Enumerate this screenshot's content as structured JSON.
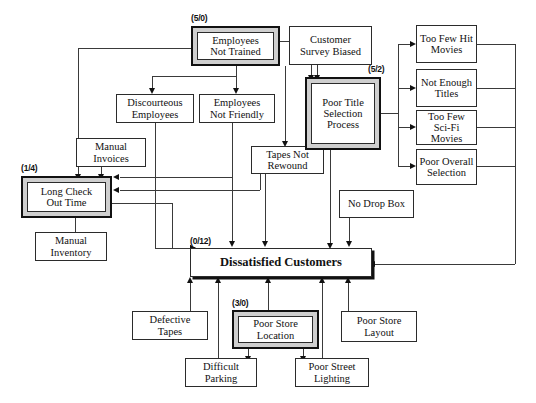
{
  "diagram": {
    "type": "cause-and-effect / interrelationship digraph",
    "effect": {
      "label": "Dissatisfied Customers",
      "tag": "(0/12)"
    },
    "nodes": [
      {
        "id": "employees_not_trained",
        "label": "Employees\nNot Trained",
        "tag": "(5/0)",
        "emphasis": true
      },
      {
        "id": "customer_survey_biased",
        "label": "Customer\nSurvey Biased",
        "tag": "",
        "emphasis": false
      },
      {
        "id": "poor_title_selection",
        "label": "Poor Title\nSelection\nProcess",
        "tag": "(5/2)",
        "emphasis": true
      },
      {
        "id": "too_few_hit_movies",
        "label": "Too Few Hit\nMovies",
        "tag": "",
        "emphasis": false
      },
      {
        "id": "not_enough_titles",
        "label": "Not Enough\nTitles",
        "tag": "",
        "emphasis": false
      },
      {
        "id": "too_few_scifi_movies",
        "label": "Too Few Sci-Fi\nMovies",
        "tag": "",
        "emphasis": false
      },
      {
        "id": "poor_overall_selection",
        "label": "Poor Overall\nSelection",
        "tag": "",
        "emphasis": false
      },
      {
        "id": "discourteous_employees",
        "label": "Discourteous\nEmployees",
        "tag": "",
        "emphasis": false
      },
      {
        "id": "employees_not_friendly",
        "label": "Employees\nNot Friendly",
        "tag": "",
        "emphasis": false
      },
      {
        "id": "manual_invoices",
        "label": "Manual\nInvoices",
        "tag": "",
        "emphasis": false
      },
      {
        "id": "tapes_not_rewound",
        "label": "Tapes Not\nRewound",
        "tag": "",
        "emphasis": false
      },
      {
        "id": "long_check_out_time",
        "label": "Long Check\nOut Time",
        "tag": "(1/4)",
        "emphasis": true
      },
      {
        "id": "manual_inventory",
        "label": "Manual\nInventory",
        "tag": "",
        "emphasis": false
      },
      {
        "id": "no_drop_box",
        "label": "No Drop Box",
        "tag": "",
        "emphasis": false
      },
      {
        "id": "defective_tapes",
        "label": "Defective\nTapes",
        "tag": "",
        "emphasis": false
      },
      {
        "id": "poor_store_location",
        "label": "Poor Store\nLocation",
        "tag": "(3/0)",
        "emphasis": true
      },
      {
        "id": "difficult_parking",
        "label": "Difficult\nParking",
        "tag": "",
        "emphasis": false
      },
      {
        "id": "poor_street_lighting",
        "label": "Poor Street\nLighting",
        "tag": "",
        "emphasis": false
      },
      {
        "id": "poor_store_layout",
        "label": "Poor Store\nLayout",
        "tag": "",
        "emphasis": false
      }
    ],
    "labels": {
      "employees_not_trained": "Employees Not Trained",
      "employees_not_trained_l1": "Employees",
      "employees_not_trained_l2": "Not Trained",
      "customer_survey_biased_l1": "Customer",
      "customer_survey_biased_l2": "Survey Biased",
      "poor_title_selection_l1": "Poor Title",
      "poor_title_selection_l2": "Selection",
      "poor_title_selection_l3": "Process",
      "too_few_hit_movies_l1": "Too Few Hit",
      "too_few_hit_movies_l2": "Movies",
      "not_enough_titles_l1": "Not Enough",
      "not_enough_titles_l2": "Titles",
      "too_few_scifi_movies_l1": "Too Few Sci-Fi",
      "too_few_scifi_movies_l2": "Movies",
      "poor_overall_selection_l1": "Poor Overall",
      "poor_overall_selection_l2": "Selection",
      "discourteous_employees_l1": "Discourteous",
      "discourteous_employees_l2": "Employees",
      "employees_not_friendly_l1": "Employees",
      "employees_not_friendly_l2": "Not Friendly",
      "manual_invoices_l1": "Manual",
      "manual_invoices_l2": "Invoices",
      "tapes_not_rewound_l1": "Tapes Not",
      "tapes_not_rewound_l2": "Rewound",
      "long_check_out_time_l1": "Long Check",
      "long_check_out_time_l2": "Out Time",
      "manual_inventory_l1": "Manual",
      "manual_inventory_l2": "Inventory",
      "no_drop_box_l1": "No Drop Box",
      "defective_tapes_l1": "Defective",
      "defective_tapes_l2": "Tapes",
      "poor_store_location_l1": "Poor Store",
      "poor_store_location_l2": "Location",
      "difficult_parking_l1": "Difficult",
      "difficult_parking_l2": "Parking",
      "poor_street_lighting_l1": "Poor Street",
      "poor_street_lighting_l2": "Lighting",
      "poor_store_layout_l1": "Poor Store",
      "poor_store_layout_l2": "Layout",
      "effect_label": "Dissatisfied Customers"
    },
    "tags": {
      "employees_not_trained": "(5/0)",
      "poor_title_selection": "(5/2)",
      "long_check_out_time": "(1/4)",
      "effect": "(0/12)",
      "poor_store_location": "(3/0)"
    },
    "colors": {
      "line": "#3a3a3a",
      "border": "#2b2b2b",
      "emphasis_fill": "#cfcfcf",
      "emphasis_border": "#111111",
      "background": "#ffffff",
      "text": "#111111"
    }
  }
}
